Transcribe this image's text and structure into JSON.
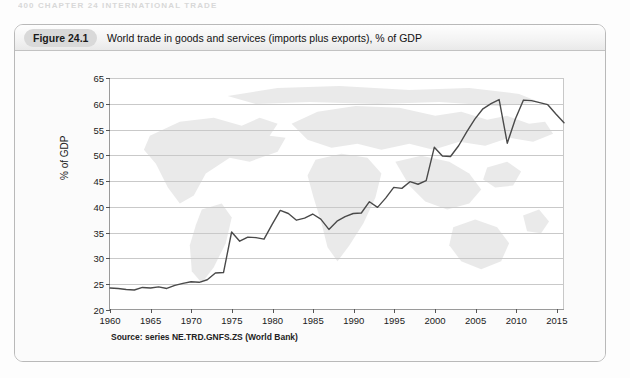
{
  "page": {
    "running_header": "400  CHAPTER 24  INTERNATIONAL TRADE"
  },
  "figure": {
    "tag": "Figure 24.1",
    "title": "World trade in goods and services (imports plus exports), % of GDP",
    "source": "Source: series NE.TRD.GNFS.ZS (World Bank)"
  },
  "chart_data": {
    "type": "line",
    "title": "World trade in goods and services (imports plus exports), % of GDP",
    "subtitle": "",
    "xlabel": "",
    "ylabel": "% of GDP",
    "xlim": [
      1960,
      2016
    ],
    "ylim": [
      20,
      65
    ],
    "ytick_step": 5,
    "xtick_step": 5,
    "grid": "horizontal",
    "legend": "none",
    "line_color": "#4a4a4a",
    "background_image": "world-map-watermark",
    "yticks": [
      20,
      25,
      30,
      35,
      40,
      45,
      50,
      55,
      60,
      65
    ],
    "xticks": [
      1960,
      1965,
      1970,
      1975,
      1980,
      1985,
      1990,
      1995,
      2000,
      2005,
      2010,
      2015
    ],
    "x": [
      1960,
      1961,
      1962,
      1963,
      1964,
      1965,
      1966,
      1967,
      1968,
      1969,
      1970,
      1971,
      1972,
      1973,
      1974,
      1975,
      1976,
      1977,
      1978,
      1979,
      1980,
      1981,
      1982,
      1983,
      1984,
      1985,
      1986,
      1987,
      1988,
      1989,
      1990,
      1991,
      1992,
      1993,
      1994,
      1995,
      1996,
      1997,
      1998,
      1999,
      2000,
      2001,
      2002,
      2003,
      2004,
      2005,
      2006,
      2007,
      2008,
      2009,
      2010,
      2011,
      2012,
      2013,
      2014,
      2015,
      2016
    ],
    "values": [
      24.1,
      24.0,
      23.8,
      23.7,
      24.2,
      24.1,
      24.3,
      24.0,
      24.6,
      25.0,
      25.3,
      25.2,
      25.7,
      27.0,
      27.1,
      35.0,
      33.2,
      34.0,
      33.9,
      33.6,
      36.5,
      39.2,
      38.6,
      37.3,
      37.7,
      38.5,
      37.5,
      35.5,
      37.1,
      38.0,
      38.6,
      38.7,
      40.9,
      39.8,
      41.6,
      43.7,
      43.5,
      44.8,
      44.3,
      45.0,
      51.5,
      49.8,
      49.7,
      51.8,
      54.5,
      57.0,
      59.0,
      60.0,
      60.8,
      52.3,
      57.0,
      60.7,
      60.6,
      60.2,
      59.8,
      58.0,
      56.3
    ],
    "series_name": "World trade (% of GDP)",
    "annotations": []
  }
}
